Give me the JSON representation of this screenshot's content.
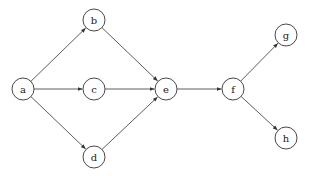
{
  "diagram": {
    "type": "directed-graph",
    "nodes": [
      {
        "id": "a",
        "label": "a",
        "x": 23,
        "y": 89
      },
      {
        "id": "b",
        "label": "b",
        "x": 94,
        "y": 20
      },
      {
        "id": "c",
        "label": "c",
        "x": 94,
        "y": 89
      },
      {
        "id": "d",
        "label": "d",
        "x": 94,
        "y": 157
      },
      {
        "id": "e",
        "label": "e",
        "x": 166,
        "y": 89
      },
      {
        "id": "f",
        "label": "f",
        "x": 233,
        "y": 89
      },
      {
        "id": "g",
        "label": "g",
        "x": 286,
        "y": 35
      },
      {
        "id": "h",
        "label": "h",
        "x": 286,
        "y": 138
      }
    ],
    "edges": [
      {
        "from": "a",
        "to": "b"
      },
      {
        "from": "a",
        "to": "c"
      },
      {
        "from": "a",
        "to": "d"
      },
      {
        "from": "b",
        "to": "e"
      },
      {
        "from": "c",
        "to": "e"
      },
      {
        "from": "d",
        "to": "e"
      },
      {
        "from": "e",
        "to": "f"
      },
      {
        "from": "f",
        "to": "g"
      },
      {
        "from": "f",
        "to": "h"
      }
    ],
    "node_radius": 11,
    "colors": {
      "stroke": "#333333",
      "fill": "#ffffff",
      "text": "#222222"
    }
  }
}
